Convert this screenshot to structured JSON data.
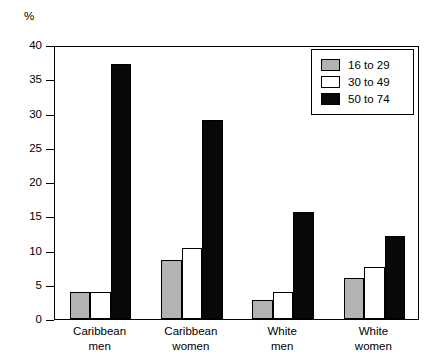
{
  "chart_data": {
    "type": "bar",
    "title": "",
    "subtitle": "",
    "xlabel": "",
    "ylabel": "%",
    "ylim": [
      0,
      40
    ],
    "yticks": [
      0,
      5,
      10,
      15,
      20,
      25,
      30,
      35,
      40
    ],
    "ytick_labels": [
      "0",
      "5",
      "10",
      "15",
      "20",
      "25",
      "30",
      "35",
      "40"
    ],
    "grid": false,
    "legend_position": "top-right",
    "categories": [
      "Caribbean men",
      "Caribbean women",
      "White men",
      "White women"
    ],
    "category_lines": [
      [
        "Caribbean",
        "men"
      ],
      [
        "Caribbean",
        "women"
      ],
      [
        "White",
        "men"
      ],
      [
        "White",
        "women"
      ]
    ],
    "series": [
      {
        "name": "16 to 29",
        "color": "#b3b3b3",
        "values": [
          3.9,
          8.6,
          2.8,
          6.0
        ]
      },
      {
        "name": "30 to 49",
        "color": "#ffffff",
        "values": [
          3.9,
          10.4,
          3.9,
          7.6
        ]
      },
      {
        "name": "50 to 74",
        "color": "#080808",
        "values": [
          37.2,
          29.0,
          15.6,
          12.1
        ]
      }
    ],
    "annotations": []
  },
  "legend": {
    "items": [
      {
        "label": "16 to 29",
        "color": "#b3b3b3"
      },
      {
        "label": "30 to 49",
        "color": "#ffffff"
      },
      {
        "label": "50 to 74",
        "color": "#080808"
      }
    ]
  },
  "axis": {
    "y_unit_label": "%"
  }
}
